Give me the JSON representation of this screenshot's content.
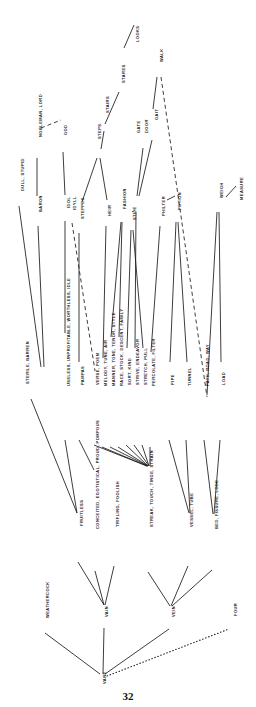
{
  "page": {
    "number": "32",
    "width": 256,
    "height": 707,
    "ink_color": "#1a1a1a"
  },
  "diagram": {
    "type": "semantic-network",
    "orientation": "rotated-90-ccw",
    "nodes": [
      {
        "id": "dull",
        "label": "DULL, STUPID",
        "x": 19,
        "y": 191
      },
      {
        "id": "baron",
        "label": "BARON",
        "x": 37,
        "y": 212
      },
      {
        "id": "nobleman",
        "label": "NOBLEMAN, LORD",
        "x": 37,
        "y": 137
      },
      {
        "id": "god",
        "label": "GOD",
        "x": 62,
        "y": 135
      },
      {
        "id": "idol",
        "label": "IDOL",
        "x": 65,
        "y": 208
      },
      {
        "id": "idyll",
        "label": "IDYLL",
        "x": 71,
        "y": 210
      },
      {
        "id": "steppes",
        "label": "STEPPES",
        "x": 79,
        "y": 219
      },
      {
        "id": "steps",
        "label": "STEPS",
        "x": 96,
        "y": 139
      },
      {
        "id": "stairs",
        "label": "STAIRS",
        "x": 104,
        "y": 113
      },
      {
        "id": "stares",
        "label": "STARES",
        "x": 120,
        "y": 83
      },
      {
        "id": "looks",
        "label": "LOOKS",
        "x": 134,
        "y": 42
      },
      {
        "id": "heir",
        "label": "HEIR",
        "x": 106,
        "y": 216
      },
      {
        "id": "fashion",
        "label": "FASHION",
        "x": 121,
        "y": 209
      },
      {
        "id": "stile",
        "label": "STILE",
        "x": 131,
        "y": 220
      },
      {
        "id": "gate",
        "label": "GATE",
        "x": 135,
        "y": 133
      },
      {
        "id": "door",
        "label": "DOOR",
        "x": 143,
        "y": 133
      },
      {
        "id": "gait",
        "label": "GAIT",
        "x": 153,
        "y": 120
      },
      {
        "id": "walk",
        "label": "WALK",
        "x": 158,
        "y": 62
      },
      {
        "id": "philter",
        "label": "PHILTER",
        "x": 160,
        "y": 216
      },
      {
        "id": "potion",
        "label": "POTION",
        "x": 176,
        "y": 210
      },
      {
        "id": "weigh",
        "label": "WEIGH",
        "x": 218,
        "y": 198
      },
      {
        "id": "measure",
        "label": "MEASURE",
        "x": 238,
        "y": 200
      },
      {
        "id": "sterile",
        "label": "STERILE, BARREN",
        "x": 24,
        "y": 384
      },
      {
        "id": "useless",
        "label": "USELESS, UNPROFITABLE, WORTHLESS, IDLE",
        "x": 65,
        "y": 386
      },
      {
        "id": "pampas",
        "label": "PAMPAS",
        "x": 79,
        "y": 385
      },
      {
        "id": "verse",
        "label": "VERSE, POEM",
        "x": 94,
        "y": 385
      },
      {
        "id": "melody",
        "label": "MELODY, TUNE, AIR",
        "x": 102,
        "y": 386
      },
      {
        "id": "manner",
        "label": "MANNER, TONE, TENOR, STYLE",
        "x": 110,
        "y": 386
      },
      {
        "id": "race",
        "label": "RACE, STOCK, DESCENT, FAMILY",
        "x": 118,
        "y": 386
      },
      {
        "id": "sort",
        "label": "SORT, KIND",
        "x": 126,
        "y": 385
      },
      {
        "id": "strive",
        "label": "STRIVE, ENDEAVOR",
        "x": 134,
        "y": 385
      },
      {
        "id": "stretch",
        "label": "STRETCH, PULL",
        "x": 142,
        "y": 385
      },
      {
        "id": "percolate",
        "label": "PERCOLATE, FILTER",
        "x": 150,
        "y": 386
      },
      {
        "id": "pipe",
        "label": "PIPE",
        "x": 169,
        "y": 385
      },
      {
        "id": "tunnel",
        "label": "TUNNEL",
        "x": 186,
        "y": 386
      },
      {
        "id": "path",
        "label": "PATH, ROAD, WAY",
        "x": 204,
        "y": 386
      },
      {
        "id": "load",
        "label": "LOAD",
        "x": 220,
        "y": 385
      },
      {
        "id": "fruitless",
        "label": "FRUITLESS",
        "x": 78,
        "y": 526
      },
      {
        "id": "conceited",
        "label": "CONCEITED, EGOTISTICAL, PROUD, POMPOUS",
        "x": 94,
        "y": 529
      },
      {
        "id": "trifling",
        "label": "TRIFLING, FOOLISH",
        "x": 114,
        "y": 527
      },
      {
        "id": "streak",
        "label": "STREAK, TOUCH, TINGE, STRAIN",
        "x": 148,
        "y": 527
      },
      {
        "id": "vessel",
        "label": "VESSEL, TUBE",
        "x": 188,
        "y": 527
      },
      {
        "id": "bed",
        "label": "BED, FISSURE, LODE",
        "x": 213,
        "y": 529
      },
      {
        "id": "weathercock",
        "label": "WEATHERCOCK",
        "x": 44,
        "y": 618
      },
      {
        "id": "vain",
        "label": "VAIN",
        "x": 103,
        "y": 617
      },
      {
        "id": "vein",
        "label": "VEIN",
        "x": 170,
        "y": 617
      },
      {
        "id": "four",
        "label": "FOUR",
        "x": 232,
        "y": 616
      },
      {
        "id": "vane",
        "label": "VANE",
        "x": 101,
        "y": 684
      }
    ],
    "edges": [
      {
        "from": "looks",
        "to": "stares",
        "style": "solid",
        "x1": 134,
        "y1": 25,
        "x2": 124,
        "y2": 48
      },
      {
        "from": "stares",
        "to": "stairs",
        "style": "solid",
        "x1": 119,
        "y1": 92,
        "x2": 105,
        "y2": 124
      },
      {
        "from": "stairs",
        "to": "steps",
        "style": "solid",
        "x1": 104,
        "y1": 131,
        "x2": 101,
        "y2": 149
      },
      {
        "from": "steps",
        "to": "steppes",
        "style": "solid",
        "x1": 97,
        "y1": 158,
        "x2": 82,
        "y2": 202
      },
      {
        "from": "steps",
        "to": "heir",
        "style": "solid",
        "x1": 100,
        "y1": 158,
        "x2": 107,
        "y2": 200
      },
      {
        "from": "god",
        "to": "idol",
        "style": "solid",
        "x1": 63,
        "y1": 152,
        "x2": 65,
        "y2": 195
      },
      {
        "from": "nobleman",
        "to": "god",
        "style": "dashed",
        "x1": 41,
        "y1": 128,
        "x2": 61,
        "y2": 120
      },
      {
        "from": "nobleman",
        "to": "baron",
        "style": "solid",
        "x1": 37,
        "y1": 158,
        "x2": 37,
        "y2": 196
      },
      {
        "from": "door",
        "to": "gate",
        "style": "solid",
        "x1": 143,
        "y1": 148,
        "x2": 137,
        "y2": 196
      },
      {
        "from": "gait",
        "to": "gate",
        "style": "solid",
        "x1": 152,
        "y1": 140,
        "x2": 139,
        "y2": 196
      },
      {
        "from": "walk",
        "to": "gait",
        "style": "solid",
        "x1": 157,
        "y1": 77,
        "x2": 153,
        "y2": 109
      },
      {
        "from": "walk",
        "to": "path",
        "style": "dashed",
        "x1": 161,
        "y1": 77,
        "x2": 207,
        "y2": 397
      },
      {
        "from": "philter",
        "to": "potion",
        "style": "solid",
        "x1": 167,
        "y1": 200,
        "x2": 175,
        "y2": 196
      },
      {
        "from": "weigh",
        "to": "measure",
        "style": "solid",
        "x1": 226,
        "y1": 197,
        "x2": 236,
        "y2": 186
      },
      {
        "from": "dull",
        "to": "sterile",
        "style": "solid",
        "x1": 19,
        "y1": 206,
        "x2": 41,
        "y2": 367
      },
      {
        "from": "baron",
        "to": "sterile",
        "style": "solid",
        "x1": 38,
        "y1": 226,
        "x2": 44,
        "y2": 367
      },
      {
        "from": "idol",
        "to": "useless",
        "style": "solid",
        "x1": 65,
        "y1": 221,
        "x2": 65,
        "y2": 333
      },
      {
        "from": "idyll",
        "to": "verse",
        "style": "dashed",
        "x1": 72,
        "y1": 223,
        "x2": 95,
        "y2": 371
      },
      {
        "from": "steppes",
        "to": "pampas",
        "style": "solid",
        "x1": 79,
        "y1": 233,
        "x2": 79,
        "y2": 362
      },
      {
        "from": "heir",
        "to": "melody",
        "style": "solid",
        "x1": 106,
        "y1": 226,
        "x2": 103,
        "y2": 358
      },
      {
        "from": "fashion",
        "to": "manner",
        "style": "solid",
        "x1": 121,
        "y1": 222,
        "x2": 111,
        "y2": 337
      },
      {
        "from": "fashion",
        "to": "race",
        "style": "solid",
        "x1": 122,
        "y1": 222,
        "x2": 119,
        "y2": 337
      },
      {
        "from": "stile",
        "to": "sort",
        "style": "solid",
        "x1": 131,
        "y1": 230,
        "x2": 127,
        "y2": 348
      },
      {
        "from": "gate",
        "to": "stile",
        "style": "solid",
        "x1": 135,
        "y1": 210,
        "x2": 132,
        "y2": 212
      },
      {
        "from": "gate",
        "to": "strive",
        "style": "solid",
        "x1": 136,
        "y1": 212,
        "x2": 135,
        "y2": 348
      },
      {
        "from": "stile",
        "to": "stretch",
        "style": "solid",
        "x1": 133,
        "y1": 230,
        "x2": 143,
        "y2": 348
      },
      {
        "from": "philter",
        "to": "percolate",
        "style": "solid",
        "x1": 160,
        "y1": 226,
        "x2": 151,
        "y2": 352
      },
      {
        "from": "potion",
        "to": "pipe",
        "style": "solid",
        "x1": 176,
        "y1": 222,
        "x2": 170,
        "y2": 362
      },
      {
        "from": "potion",
        "to": "tunnel",
        "style": "solid",
        "x1": 178,
        "y1": 222,
        "x2": 187,
        "y2": 362
      },
      {
        "from": "weigh",
        "to": "path",
        "style": "solid",
        "x1": 217,
        "y1": 212,
        "x2": 207,
        "y2": 395
      },
      {
        "from": "weigh",
        "to": "load",
        "style": "solid",
        "x1": 219,
        "y1": 212,
        "x2": 221,
        "y2": 362
      },
      {
        "from": "sterile",
        "to": "fruitless",
        "style": "solid",
        "x1": 31,
        "y1": 399,
        "x2": 77,
        "y2": 513
      },
      {
        "from": "useless",
        "to": "fruitless",
        "style": "solid",
        "x1": 65,
        "y1": 440,
        "x2": 77,
        "y2": 513
      },
      {
        "from": "pampas",
        "to": "conceited",
        "style": "solid",
        "x1": 79,
        "y1": 440,
        "x2": 94,
        "y2": 470
      },
      {
        "from": "verse",
        "to": "streak",
        "style": "solid",
        "x1": 94,
        "y1": 445,
        "x2": 147,
        "y2": 466
      },
      {
        "from": "melody",
        "to": "streak",
        "style": "solid",
        "x1": 102,
        "y1": 447,
        "x2": 147,
        "y2": 466
      },
      {
        "from": "manner",
        "to": "streak",
        "style": "solid",
        "x1": 110,
        "y1": 447,
        "x2": 148,
        "y2": 466
      },
      {
        "from": "race",
        "to": "streak",
        "style": "solid",
        "x1": 118,
        "y1": 447,
        "x2": 148,
        "y2": 466
      },
      {
        "from": "sort",
        "to": "streak",
        "style": "solid",
        "x1": 126,
        "y1": 445,
        "x2": 148,
        "y2": 466
      },
      {
        "from": "strive",
        "to": "streak",
        "style": "solid",
        "x1": 134,
        "y1": 445,
        "x2": 149,
        "y2": 466
      },
      {
        "from": "stretch",
        "to": "streak",
        "style": "solid",
        "x1": 142,
        "y1": 445,
        "x2": 149,
        "y2": 466
      },
      {
        "from": "percolate",
        "to": "streak",
        "style": "solid",
        "x1": 150,
        "y1": 447,
        "x2": 150,
        "y2": 466
      },
      {
        "from": "pipe",
        "to": "vessel",
        "style": "solid",
        "x1": 169,
        "y1": 440,
        "x2": 189,
        "y2": 513
      },
      {
        "from": "tunnel",
        "to": "vessel",
        "style": "solid",
        "x1": 186,
        "y1": 440,
        "x2": 190,
        "y2": 513
      },
      {
        "from": "path",
        "to": "bed",
        "style": "solid",
        "x1": 204,
        "y1": 440,
        "x2": 213,
        "y2": 514
      },
      {
        "from": "load",
        "to": "bed",
        "style": "solid",
        "x1": 220,
        "y1": 440,
        "x2": 214,
        "y2": 514
      },
      {
        "from": "fruitless",
        "to": "vain",
        "style": "solid",
        "x1": 78,
        "y1": 562,
        "x2": 104,
        "y2": 605
      },
      {
        "from": "conceited",
        "to": "vain",
        "style": "solid",
        "x1": 95,
        "y1": 571,
        "x2": 104,
        "y2": 605
      },
      {
        "from": "trifling",
        "to": "vain",
        "style": "solid",
        "x1": 114,
        "y1": 566,
        "x2": 105,
        "y2": 605
      },
      {
        "from": "streak",
        "to": "vein",
        "style": "solid",
        "x1": 148,
        "y1": 572,
        "x2": 170,
        "y2": 606
      },
      {
        "from": "vessel",
        "to": "vein",
        "style": "solid",
        "x1": 188,
        "y1": 566,
        "x2": 171,
        "y2": 606
      },
      {
        "from": "bed",
        "to": "vein",
        "style": "solid",
        "x1": 212,
        "y1": 570,
        "x2": 172,
        "y2": 606
      },
      {
        "from": "weathercock",
        "to": "vane",
        "style": "solid",
        "x1": 45,
        "y1": 633,
        "x2": 100,
        "y2": 674
      },
      {
        "from": "vain",
        "to": "vane",
        "style": "solid",
        "x1": 104,
        "y1": 628,
        "x2": 103,
        "y2": 674
      },
      {
        "from": "vein",
        "to": "vane",
        "style": "solid",
        "x1": 169,
        "y1": 629,
        "x2": 105,
        "y2": 674
      },
      {
        "from": "vane",
        "to": "four",
        "style": "dotted",
        "x1": 107,
        "y1": 676,
        "x2": 229,
        "y2": 629
      }
    ]
  }
}
